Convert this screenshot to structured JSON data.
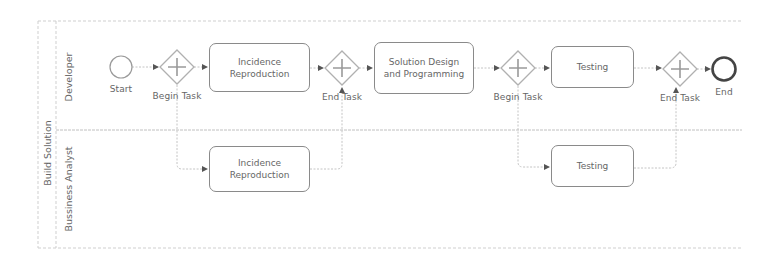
{
  "pool": {
    "label": "Build Solution",
    "lanes": [
      {
        "label": "Developer"
      },
      {
        "label": "Bussiness Analyst"
      }
    ]
  },
  "events": {
    "start": {
      "label": "Start"
    },
    "end": {
      "label": "End"
    }
  },
  "gateways": [
    {
      "id": "g1",
      "type": "parallel",
      "label": "Begin Task"
    },
    {
      "id": "g2",
      "type": "parallel",
      "label": "End Task"
    },
    {
      "id": "g3",
      "type": "parallel",
      "label": "Begin Task"
    },
    {
      "id": "g4",
      "type": "parallel",
      "label": "End Task"
    }
  ],
  "tasks": {
    "developer": [
      {
        "id": "t1",
        "label": "Incidence Reproduction"
      },
      {
        "id": "t2",
        "label": "Solution Design and Programming"
      },
      {
        "id": "t3",
        "label": "Testing"
      }
    ],
    "analyst": [
      {
        "id": "t4",
        "label": "Incidence Reproduction"
      },
      {
        "id": "t5",
        "label": "Testing"
      }
    ]
  },
  "colors": {
    "stroke": "#8a8a8a",
    "gateway": "#b0b0b0",
    "lane_line": "#c8c8c8",
    "text": "#666666"
  }
}
